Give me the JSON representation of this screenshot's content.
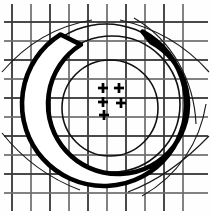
{
  "figure": {
    "background_color": "#fefefe",
    "ink_color": "#000000",
    "grid_color": "#3a3a3a",
    "width": 212,
    "height": 215
  },
  "grid": {
    "label": "Square measurement grid",
    "vertical_x": [
      12,
      31,
      50,
      69,
      88,
      107,
      126,
      145,
      164,
      183
    ],
    "horizontal_y": [
      22,
      41,
      60,
      79,
      98,
      117,
      136,
      155,
      174,
      193
    ],
    "spacing": 19,
    "line_count_vertical": 10,
    "line_count_horizontal": 10
  },
  "shapes": {
    "outer_circle": {
      "name": "outer-circle",
      "cx": 106,
      "cy": 104,
      "r": 80
    },
    "mid_circle": {
      "name": "mid-circle",
      "cx": 112,
      "cy": 104,
      "r": 68
    },
    "inner_circle": {
      "name": "inner-circle",
      "cx": 110,
      "cy": 108,
      "r": 48
    },
    "crescent": {
      "name": "crescent",
      "outer_cx": 104,
      "outer_cy": 104,
      "outer_r": 82,
      "inner_cx": 118,
      "inner_cy": 104,
      "inner_r": 70,
      "gap_opening": "top-right",
      "stroke_weight": "heavy"
    },
    "tangent_arcs": [
      {
        "name": "tangent-arc-upper-left",
        "path": "M 2,72 C 26,44 56,26 92,20"
      },
      {
        "name": "tangent-arc-upper-right",
        "path": "M 120,20 C 156,28 186,46 209,72"
      },
      {
        "name": "tangent-arc-lower-left",
        "path": "M 2,133 C 22,158 48,178 80,190"
      },
      {
        "name": "tangent-arc-lower-right",
        "path": "M 128,192 C 160,180 186,160 209,136"
      },
      {
        "name": "sweep-arc-right-upper",
        "path": "M 134,18 C 172,40 194,80 196,124"
      },
      {
        "name": "sweep-arc-right-lower",
        "path": "M 142,196 C 178,176 200,142 206,104"
      }
    ]
  },
  "plus_marks": {
    "label": "Plus mark cluster",
    "arm": 5,
    "points": [
      {
        "name": "plus-mark-1",
        "x": 103,
        "y": 88
      },
      {
        "name": "plus-mark-2",
        "x": 119,
        "y": 88
      },
      {
        "name": "plus-mark-3",
        "x": 103,
        "y": 102
      },
      {
        "name": "plus-mark-4",
        "x": 121,
        "y": 103
      },
      {
        "name": "plus-mark-5",
        "x": 104,
        "y": 115
      }
    ]
  }
}
